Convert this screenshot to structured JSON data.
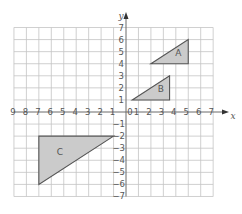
{
  "diagram": {
    "type": "coordinate-grid",
    "x_axis": {
      "label": "x",
      "min": -9,
      "max": 7,
      "ticks_negative": [
        "9",
        "8",
        "7",
        "6",
        "5",
        "4",
        "3",
        "2",
        "1"
      ],
      "ticks_positive": [
        "1",
        "2",
        "3",
        "4",
        "5",
        "6",
        "7"
      ]
    },
    "y_axis": {
      "label": "y",
      "min": -7,
      "max": 7,
      "ticks_positive": [
        "1",
        "2",
        "3",
        "4",
        "5",
        "6",
        "7"
      ],
      "ticks_negative": [
        "−1",
        "−2",
        "−3",
        "−4",
        "−5",
        "−6",
        "−7"
      ]
    },
    "origin_label": "0",
    "shapes": [
      {
        "label": "A",
        "vertices": [
          [
            2,
            4
          ],
          [
            5,
            4
          ],
          [
            5,
            6
          ]
        ],
        "label_pos": [
          4.2,
          4.9
        ]
      },
      {
        "label": "B",
        "vertices": [
          [
            0.5,
            1
          ],
          [
            3.5,
            1
          ],
          [
            3.5,
            3
          ]
        ],
        "label_pos": [
          2.8,
          1.9
        ]
      },
      {
        "label": "C",
        "vertices": [
          [
            -7,
            -2
          ],
          [
            -1,
            -2
          ],
          [
            -7,
            -6
          ]
        ],
        "label_pos": [
          -5.3,
          -3.3
        ]
      }
    ],
    "colors": {
      "grid": "#c4c4c4",
      "axis": "#6a6a6a",
      "shape_fill": "#cbcbcb",
      "shape_stroke": "#555555",
      "text": "#555555"
    }
  }
}
